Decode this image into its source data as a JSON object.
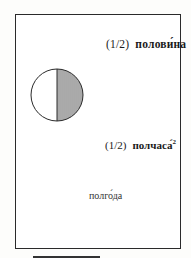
{
  "figure": {
    "items": [
      {
        "fraction": "(1/2)",
        "word": "полови́на"
      },
      {
        "fraction": "(1/2)",
        "word": "полчаса́",
        "footnote": "2"
      },
      {
        "word": "полго́да"
      }
    ],
    "diagram": {
      "shape": "circle",
      "shaded_half": "right",
      "fill": "vertical-hatch",
      "color": "#2a2a2a"
    }
  }
}
